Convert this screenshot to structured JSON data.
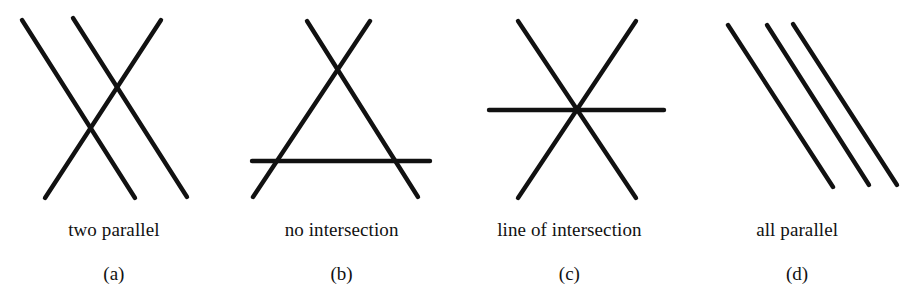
{
  "figure": {
    "background_color": "#ffffff",
    "stroke_color": "#111111",
    "stroke_width": 4.4,
    "width": 911,
    "height": 303,
    "panels": [
      {
        "id": "a",
        "label": "(a)",
        "caption": "two parallel",
        "description": "Three lines: two parallel descending lines crossed by one ascending line, producing two separate intersection points.",
        "intersection_count": 2,
        "lines": [
          {
            "name": "descending-line-1",
            "x1": 22,
            "y1": 20,
            "x2": 135,
            "y2": 198
          },
          {
            "name": "descending-line-2",
            "x1": 73,
            "y1": 18,
            "x2": 187,
            "y2": 197
          },
          {
            "name": "ascending-line",
            "x1": 45,
            "y1": 198,
            "x2": 161,
            "y2": 20
          }
        ],
        "intersections": [
          {
            "x": 91,
            "y": 127
          },
          {
            "x": 118,
            "y": 86
          }
        ]
      },
      {
        "id": "b",
        "label": "(b)",
        "caption": "no intersection",
        "description": "Three lines forming an open triangle: two diagonals crossing above a horizontal line, with three distinct pairwise intersection points.",
        "intersection_count": 3,
        "lines": [
          {
            "name": "descending-diagonal",
            "x1": 307,
            "y1": 21,
            "x2": 418,
            "y2": 197
          },
          {
            "name": "ascending-diagonal",
            "x1": 253,
            "y1": 197,
            "x2": 370,
            "y2": 21
          },
          {
            "name": "horizontal-line",
            "x1": 252,
            "y1": 161,
            "x2": 430,
            "y2": 161
          }
        ],
        "intersections": [
          {
            "x": 340,
            "y": 73
          },
          {
            "x": 278,
            "y": 161
          },
          {
            "x": 409,
            "y": 161
          }
        ]
      },
      {
        "id": "c",
        "label": "(c)",
        "caption": "line of intersection",
        "description": "Three concurrent lines meeting at one common point, forming a six-pointed asterisk.",
        "intersection_count": 1,
        "lines": [
          {
            "name": "descending-diagonal",
            "x1": 518,
            "y1": 21,
            "x2": 636,
            "y2": 198
          },
          {
            "name": "ascending-diagonal",
            "x1": 518,
            "y1": 198,
            "x2": 636,
            "y2": 21
          },
          {
            "name": "horizontal-line",
            "x1": 489,
            "y1": 110,
            "x2": 664,
            "y2": 110
          }
        ],
        "intersections": [
          {
            "x": 577,
            "y": 110
          }
        ]
      },
      {
        "id": "d",
        "label": "(d)",
        "caption": "all parallel",
        "description": "Three mutually parallel descending lines with no intersections.",
        "intersection_count": 0,
        "lines": [
          {
            "name": "parallel-line-1",
            "x1": 728,
            "y1": 25,
            "x2": 833,
            "y2": 187
          },
          {
            "name": "parallel-line-2",
            "x1": 767,
            "y1": 25,
            "x2": 869,
            "y2": 185
          },
          {
            "name": "parallel-line-3",
            "x1": 793,
            "y1": 24,
            "x2": 897,
            "y2": 185
          }
        ],
        "intersections": []
      }
    ]
  }
}
